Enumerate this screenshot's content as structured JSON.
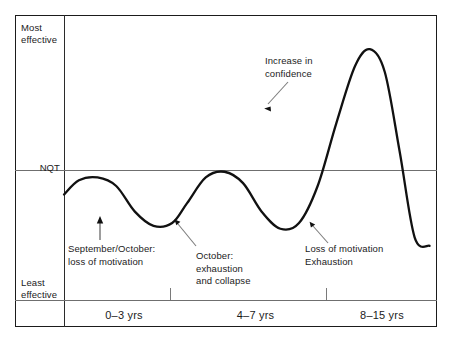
{
  "chart_data": {
    "type": "line",
    "title": "",
    "xlabel": "",
    "ylabel": "",
    "grid": false,
    "legend": null,
    "baseline_label": "NQT",
    "y_axis": {
      "top_label": "Most\neffective",
      "mid_label": "NQT",
      "bottom_label": "Least\neffective",
      "ylim": [
        0,
        1
      ]
    },
    "x_axis": {
      "categories": [
        "0–3 yrs",
        "4–7 yrs",
        "8–15 yrs"
      ],
      "tick_positions": [
        0.283,
        0.702
      ]
    },
    "series": [
      {
        "name": "Teacher effectiveness over career",
        "x": [
          0.0,
          0.04,
          0.09,
          0.14,
          0.19,
          0.24,
          0.29,
          0.33,
          0.38,
          0.43,
          0.48,
          0.53,
          0.58,
          0.63,
          0.68,
          0.73,
          0.78,
          0.82,
          0.86,
          0.9,
          0.94,
          0.98
        ],
        "y": [
          0.37,
          0.42,
          0.43,
          0.4,
          0.31,
          0.26,
          0.27,
          0.34,
          0.43,
          0.45,
          0.41,
          0.31,
          0.25,
          0.27,
          0.4,
          0.62,
          0.82,
          0.88,
          0.8,
          0.52,
          0.22,
          0.19
        ]
      }
    ],
    "annotations": [
      {
        "name": "increase-in-confidence",
        "text": "Increase in\nconfidence",
        "points_to": "curve peak"
      },
      {
        "name": "september-october-loss-of-motivation",
        "text": "September/October:\nloss of motivation",
        "points_to": "first trough"
      },
      {
        "name": "october-exhaustion-and-collapse",
        "text": "October:\nexhaustion\nand collapse",
        "points_to": "second trough"
      },
      {
        "name": "loss-of-motivation-exhaustion",
        "text": "Loss of motivation\nExhaustion",
        "points_to": "final trough"
      }
    ],
    "colors": {
      "curve": "#111111",
      "frame": "#1b1b1b",
      "axis_line": "#6f6f6f",
      "text": "#1b1b1b",
      "background": "#ffffff"
    }
  },
  "axes": {
    "y_most": "Most\neffective",
    "y_nqt": "NQT",
    "y_least": "Least\neffective",
    "x_band_1": "0–3 yrs",
    "x_band_2": "4–7 yrs",
    "x_band_3": "8–15 yrs"
  },
  "annotations": {
    "confidence": "Increase in\nconfidence",
    "september": "September/October:\nloss of motivation",
    "october": "October:\nexhaustion\nand collapse",
    "loss": "Loss of motivation\nExhaustion"
  }
}
